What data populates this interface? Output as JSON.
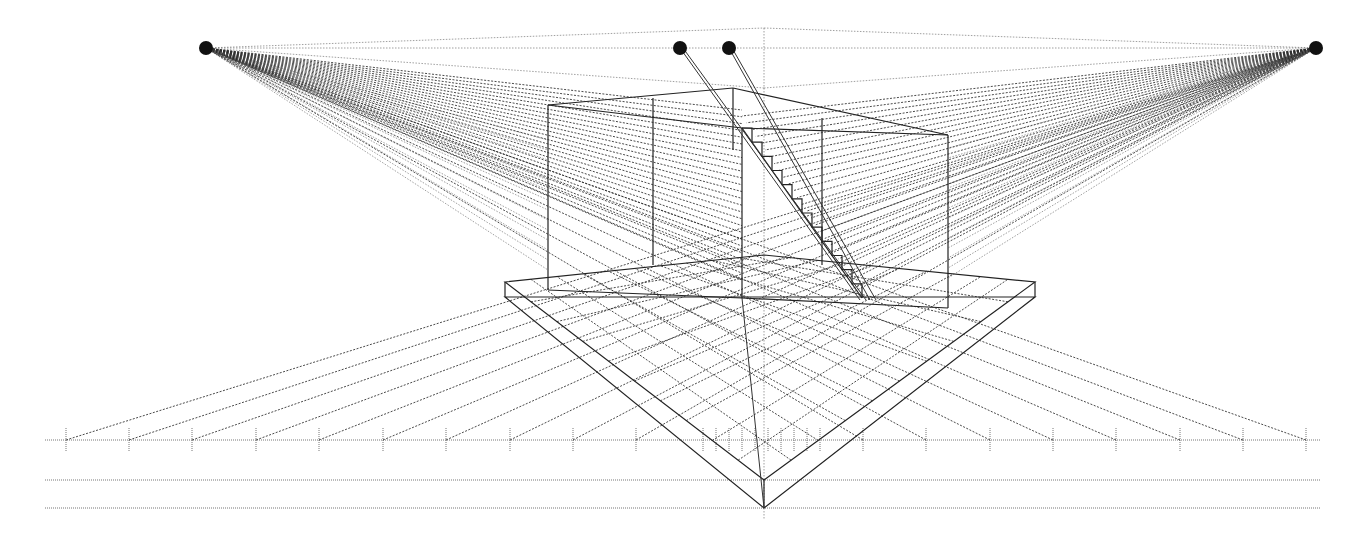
{
  "diagram": {
    "title": "",
    "type": "two-point perspective construction",
    "colors": {
      "background": "#ffffff",
      "lines": "#222222",
      "guides": "#777777",
      "vanishing_points": "#111111"
    },
    "vanishing_points": [
      {
        "name": "left-vp",
        "x": 206,
        "y": 48
      },
      {
        "name": "center-vp-a",
        "x": 680,
        "y": 48
      },
      {
        "name": "center-vp-b",
        "x": 729,
        "y": 48
      },
      {
        "name": "right-vp",
        "x": 1316,
        "y": 48
      }
    ],
    "horizon_y": 48,
    "measuring_line": {
      "y": 440,
      "x_start": 45,
      "x_end": 1320,
      "ticks": [
        66,
        129,
        192,
        256,
        319,
        383,
        446,
        510,
        573,
        636,
        703,
        716,
        729,
        742,
        755,
        768,
        781,
        794,
        807,
        820,
        863,
        926,
        990,
        1053,
        1116,
        1180,
        1243,
        1306
      ]
    },
    "ground_lines": [
      {
        "y": 480,
        "x_start": 45,
        "x_end": 1320
      },
      {
        "y": 508,
        "x_start": 45,
        "x_end": 1320
      }
    ],
    "station_point": {
      "x": 764,
      "y": 508
    },
    "box": {
      "front_corner_x": 742,
      "top_y": 128,
      "bottom_y": 298,
      "left_x": 548,
      "right_x": 948
    },
    "staircase": {
      "steps": 12
    }
  }
}
